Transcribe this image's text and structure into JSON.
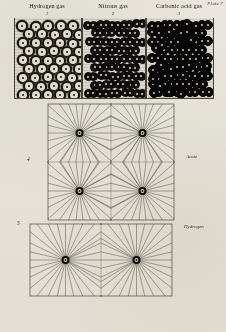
{
  "plate": {
    "number_label": "Plate 7"
  },
  "gas_panels": [
    {
      "title": "Hydrogen gas",
      "figure_number": "1",
      "particle_style": "single-ringed-atom",
      "description": "open circles with dark ring and central dot"
    },
    {
      "title": "Nitrous gas",
      "figure_number": "2",
      "particle_style": "dark-paired-atoms",
      "description": "dark diatomic pairs"
    },
    {
      "title": "Carbonic acid gas",
      "figure_number": "3",
      "particle_style": "dense-dark-clusters",
      "description": "dense dark clustered molecules"
    }
  ],
  "figures": [
    {
      "number": "4",
      "label": "Azote",
      "nodes": 4,
      "description": "square lattice with four radiating centres"
    },
    {
      "number": "5",
      "label": "Hydrogen",
      "nodes": 2,
      "description": "rectangular lattice with two radiating centres"
    }
  ],
  "colors": {
    "paper": "#f3f1ec",
    "ink": "#17140f",
    "line": "#2e2a24",
    "grid": "#6b665d"
  }
}
